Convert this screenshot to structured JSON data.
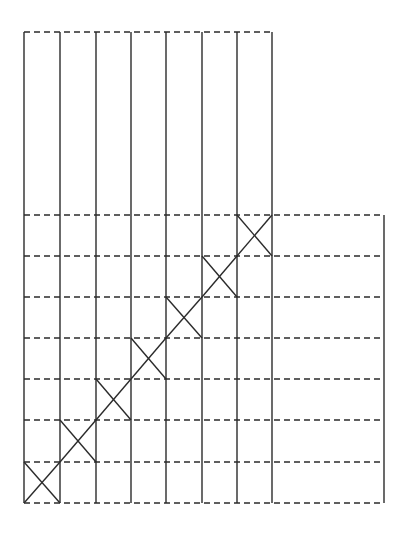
{
  "diagram": {
    "stroke_color": "#2b2b2b",
    "background": "#ffffff",
    "columns_x": [
      24,
      60,
      96,
      131,
      166,
      202,
      237,
      272
    ],
    "right_edge_x": 384,
    "top_line_y": 32,
    "rows_y": [
      215,
      256,
      297,
      338,
      379,
      420,
      462,
      503
    ],
    "crosses": [
      {
        "col": 0,
        "row": 6
      },
      {
        "col": 1,
        "row": 5
      },
      {
        "col": 2,
        "row": 4
      },
      {
        "col": 3,
        "row": 3
      },
      {
        "col": 4,
        "row": 2
      },
      {
        "col": 5,
        "row": 1
      },
      {
        "col": 6,
        "row": 0
      }
    ]
  }
}
